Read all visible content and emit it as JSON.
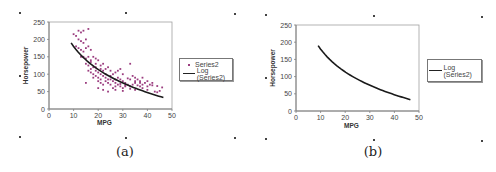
{
  "chart_data": [
    {
      "id": "a",
      "type": "scatter",
      "caption": "(a)",
      "title": "",
      "xlabel": "MPG",
      "ylabel": "Horsepower",
      "xlim": [
        0,
        50
      ],
      "ylim": [
        0,
        250
      ],
      "xticks": [
        0,
        10,
        20,
        30,
        40,
        50
      ],
      "yticks": [
        0,
        50,
        100,
        150,
        200,
        250
      ],
      "grid": false,
      "legend_position": "right",
      "series": [
        {
          "name": "Series2",
          "kind": "scatter",
          "color": "#9b3d7f",
          "description": "≈390 car records, horsepower decreasing with MPG; dense cluster MPG 15–35, HP 50–130; high HP (180–230) at MPG 10–16",
          "points": [
            [
              10,
              215
            ],
            [
              11,
              210
            ],
            [
              12,
              225
            ],
            [
              13,
              220
            ],
            [
              14,
              225
            ],
            [
              16,
              230
            ],
            [
              12,
              200
            ],
            [
              13,
              195
            ],
            [
              14,
              190
            ],
            [
              15,
              200
            ],
            [
              11,
              180
            ],
            [
              12,
              175
            ],
            [
              13,
              170
            ],
            [
              14,
              165
            ],
            [
              15,
              175
            ],
            [
              16,
              180
            ],
            [
              17,
              170
            ],
            [
              13,
              150
            ],
            [
              14,
              150
            ],
            [
              15,
              145
            ],
            [
              16,
              150
            ],
            [
              17,
              140
            ],
            [
              18,
              150
            ],
            [
              19,
              145
            ],
            [
              15,
              130
            ],
            [
              16,
              125
            ],
            [
              17,
              135
            ],
            [
              18,
              120
            ],
            [
              19,
              130
            ],
            [
              20,
              140
            ],
            [
              21,
              125
            ],
            [
              22,
              130
            ],
            [
              16,
              110
            ],
            [
              17,
              105
            ],
            [
              18,
              100
            ],
            [
              19,
              110
            ],
            [
              20,
              105
            ],
            [
              21,
              100
            ],
            [
              22,
              110
            ],
            [
              23,
              115
            ],
            [
              24,
              120
            ],
            [
              25,
              110
            ],
            [
              18,
              90
            ],
            [
              19,
              95
            ],
            [
              20,
              90
            ],
            [
              21,
              85
            ],
            [
              22,
              95
            ],
            [
              23,
              90
            ],
            [
              24,
              85
            ],
            [
              25,
              95
            ],
            [
              26,
              100
            ],
            [
              27,
              105
            ],
            [
              28,
              110
            ],
            [
              29,
              115
            ],
            [
              30,
              100
            ],
            [
              20,
              80
            ],
            [
              21,
              75
            ],
            [
              22,
              70
            ],
            [
              23,
              80
            ],
            [
              24,
              75
            ],
            [
              25,
              70
            ],
            [
              26,
              80
            ],
            [
              27,
              85
            ],
            [
              28,
              90
            ],
            [
              29,
              85
            ],
            [
              30,
              80
            ],
            [
              31,
              75
            ],
            [
              32,
              88
            ],
            [
              33,
              130
            ],
            [
              34,
              95
            ],
            [
              35,
              90
            ],
            [
              36,
              85
            ],
            [
              37,
              80
            ],
            [
              38,
              90
            ],
            [
              26,
              60
            ],
            [
              27,
              65
            ],
            [
              28,
              70
            ],
            [
              29,
              65
            ],
            [
              30,
              60
            ],
            [
              31,
              68
            ],
            [
              32,
              70
            ],
            [
              33,
              65
            ],
            [
              34,
              70
            ],
            [
              35,
              75
            ],
            [
              36,
              68
            ],
            [
              37,
              65
            ],
            [
              38,
              70
            ],
            [
              39,
              75
            ],
            [
              40,
              65
            ],
            [
              41,
              70
            ],
            [
              42,
              75
            ],
            [
              24,
              50
            ],
            [
              27,
              55
            ],
            [
              30,
              52
            ],
            [
              33,
              58
            ],
            [
              35,
              55
            ],
            [
              38,
              60
            ],
            [
              40,
              55
            ],
            [
              43,
              50
            ],
            [
              44,
              48
            ],
            [
              45,
              52
            ],
            [
              46,
              62
            ],
            [
              15,
              75
            ],
            [
              20,
              60
            ],
            [
              22,
              55
            ],
            [
              17,
              115
            ],
            [
              19,
              120
            ],
            [
              21,
              115
            ],
            [
              23,
              100
            ],
            [
              25,
              85
            ],
            [
              27,
              75
            ],
            [
              29,
              72
            ],
            [
              31,
              65
            ],
            [
              33,
              85
            ],
            [
              35,
              80
            ],
            [
              37,
              75
            ],
            [
              40,
              80
            ],
            [
              42,
              68
            ],
            [
              44,
              66
            ]
          ]
        },
        {
          "name": "Log  (Series2)",
          "kind": "trendline",
          "color": "#1a1a1a",
          "model": "logarithmic",
          "equation": "y ≈ 400 - 95.6·ln(x)",
          "x_range": [
            9,
            46.5
          ],
          "endpoints": [
            [
              9,
              190
            ],
            [
              46.5,
              33
            ]
          ]
        }
      ]
    },
    {
      "id": "b",
      "type": "line",
      "caption": "(b)",
      "title": "",
      "xlabel": "MPG",
      "ylabel": "Horsepower",
      "xlim": [
        0,
        50
      ],
      "ylim": [
        0,
        250
      ],
      "xticks": [
        0,
        10,
        20,
        30,
        40,
        50
      ],
      "yticks": [
        0,
        50,
        100,
        150,
        200,
        250
      ],
      "grid": false,
      "legend_position": "right",
      "series": [
        {
          "name": "Log  (Series2)",
          "kind": "trendline",
          "color": "#1a1a1a",
          "model": "logarithmic",
          "equation": "y ≈ 400 - 95.6·ln(x)",
          "x_range": [
            9,
            46.5
          ],
          "endpoints": [
            [
              9,
              190
            ],
            [
              46.5,
              33
            ]
          ]
        }
      ]
    }
  ],
  "panels": {
    "a": {
      "caption": "(a)",
      "xlabel": "MPG",
      "ylabel": "Horsepower",
      "legend": [
        "Series2",
        "Log  (Series2)"
      ]
    },
    "b": {
      "caption": "(b)",
      "xlabel": "MPG",
      "ylabel": "Horsepower",
      "legend": [
        "Log  (Series2)"
      ]
    }
  },
  "colors": {
    "scatter": "#9b3d7f",
    "trendline": "#1a1a1a",
    "axis": "#808080",
    "plot_border": "#a0a0a0",
    "text": "#444444"
  }
}
